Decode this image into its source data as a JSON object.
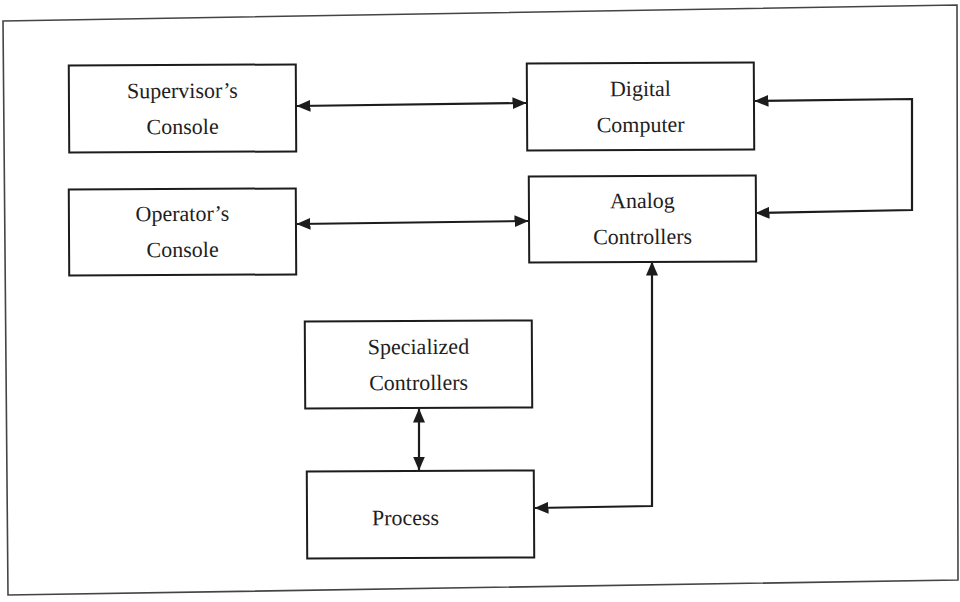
{
  "diagram": {
    "type": "block-diagram",
    "title": "",
    "colors": {
      "line": "#1c1c1c",
      "text": "#1e1e1e",
      "background": "#ffffff",
      "frame": "#444444"
    },
    "blocks": {
      "supervisor_console": {
        "line1": "Supervisor’s",
        "line2": "Console"
      },
      "operator_console": {
        "line1": "Operator’s",
        "line2": "Console"
      },
      "digital_computer": {
        "line1": "Digital",
        "line2": "Computer"
      },
      "analog_controllers": {
        "line1": "Analog",
        "line2": "Controllers"
      },
      "specialized_controllers": {
        "line1": "Specialized",
        "line2": "Controllers"
      },
      "process": {
        "line1": "Process"
      }
    },
    "connections": [
      {
        "from": "Supervisor’s Console",
        "to": "Digital Computer",
        "direction": "bidirectional"
      },
      {
        "from": "Operator’s Console",
        "to": "Analog Controllers",
        "direction": "bidirectional"
      },
      {
        "from": "Right loop",
        "to": "Digital Computer",
        "direction": "into-target"
      },
      {
        "from": "Right loop",
        "to": "Analog Controllers",
        "direction": "into-target"
      },
      {
        "from": "Specialized Controllers",
        "to": "Process",
        "direction": "bidirectional"
      },
      {
        "from": "Analog Controllers",
        "to": "Process",
        "direction": "bidirectional"
      }
    ]
  }
}
